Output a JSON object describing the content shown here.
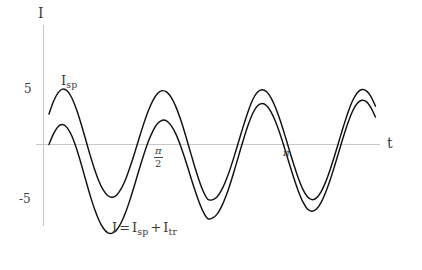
{
  "chart_data": {
    "type": "line",
    "title": "",
    "xlabel": "t",
    "ylabel": "I",
    "xlim": [
      -0.06,
      3.65
    ],
    "ylim": [
      -9.5,
      9.5
    ],
    "grid": false,
    "legend_position": "inline-annotations",
    "axis_labels": {
      "y_axis_symbol": "I",
      "x_axis_symbol": "t"
    },
    "y_ticks": [
      {
        "value": 5,
        "label": "5"
      },
      {
        "value": -5,
        "label": "-5"
      }
    ],
    "x_ticks": [
      {
        "value": 1.5707963,
        "label_numerator": "π",
        "label_denominator": "2"
      },
      {
        "value": 3.1415927,
        "label": "π"
      }
    ],
    "annotations": [
      {
        "name": "steady-state-curve-label",
        "text": "I_sp",
        "base": "I",
        "subscript": "sp",
        "x": 0.35,
        "y": 5.2
      },
      {
        "name": "total-curve-label",
        "text": "I = I_sp + I_tr",
        "parts": [
          "I",
          "=",
          "I",
          "sp",
          "+",
          "I",
          "tr"
        ],
        "x": 1.0,
        "y": -7.2
      }
    ],
    "series": [
      {
        "name": "I_sp",
        "label": "I_sp",
        "color": "#111111",
        "description": "steady-state sinusoidal current",
        "amplitude": 5.1,
        "angular_frequency": 6.0,
        "phase": 0.58,
        "points_x": [
          0.0,
          0.05,
          0.1,
          0.15,
          0.2,
          0.25,
          0.3,
          0.35,
          0.4,
          0.45,
          0.5,
          0.55,
          0.6,
          0.65,
          0.7,
          0.75,
          0.8,
          0.85,
          0.9,
          0.95,
          1.0,
          1.05,
          1.1,
          1.15,
          1.2,
          1.25,
          1.3,
          1.35,
          1.4,
          1.45,
          1.5,
          1.55,
          1.6,
          1.65,
          1.7,
          1.75,
          1.8,
          1.85,
          1.9,
          1.95,
          2.0,
          2.05,
          2.1,
          2.15,
          2.2,
          2.25,
          2.3,
          2.35,
          2.4,
          2.45,
          2.5,
          2.55,
          2.6,
          2.65,
          2.7,
          2.75,
          2.8,
          2.85,
          2.9,
          2.95,
          3.0,
          3.05,
          3.1,
          3.15,
          3.2,
          3.25,
          3.3,
          3.35,
          3.4,
          3.45,
          3.5,
          3.55,
          3.6
        ],
        "points_y": [
          2.79,
          3.94,
          4.74,
          5.08,
          4.93,
          4.31,
          3.3,
          2.02,
          0.59,
          -0.86,
          -2.2,
          -3.34,
          -4.19,
          -4.7,
          -4.84,
          -4.6,
          -4.0,
          -3.09,
          -1.93,
          -0.63,
          0.73,
          2.03,
          3.19,
          4.1,
          4.7,
          4.94,
          4.8,
          4.29,
          3.45,
          2.33,
          1.01,
          -0.41,
          -1.83,
          -3.16,
          -4.27,
          -5.02,
          -5.08,
          -4.84,
          -4.24,
          -3.33,
          -2.19,
          -0.88,
          0.5,
          1.87,
          3.13,
          4.17,
          4.81,
          5.03,
          4.84,
          4.26,
          3.35,
          2.2,
          0.88,
          -0.5,
          -1.85,
          -3.1,
          -4.12,
          -4.8,
          -5.06,
          -4.9,
          -4.34,
          -3.45,
          -2.31,
          -1.01,
          0.37,
          1.74,
          3.01,
          4.06,
          4.75,
          5.04,
          4.92,
          4.39,
          3.52
        ]
      },
      {
        "name": "I_total",
        "label": "I = I_sp + I_tr",
        "color": "#111111",
        "description": "total current = steady state plus decaying transient",
        "transient_amplitude": -2.8,
        "transient_decay": 0.95,
        "points_x": [
          0.0,
          0.05,
          0.1,
          0.15,
          0.2,
          0.25,
          0.3,
          0.35,
          0.4,
          0.45,
          0.5,
          0.55,
          0.6,
          0.65,
          0.7,
          0.75,
          0.8,
          0.85,
          0.9,
          0.95,
          1.0,
          1.05,
          1.1,
          1.15,
          1.2,
          1.25,
          1.3,
          1.35,
          1.4,
          1.45,
          1.5,
          1.55,
          1.6,
          1.65,
          1.7,
          1.75,
          1.8,
          1.85,
          1.9,
          1.95,
          2.0,
          2.05,
          2.1,
          2.15,
          2.2,
          2.25,
          2.3,
          2.35,
          2.4,
          2.45,
          2.5,
          2.55,
          2.6,
          2.65,
          2.7,
          2.75,
          2.8,
          2.85,
          2.9,
          2.95,
          3.0,
          3.05,
          3.1,
          3.15,
          3.2,
          3.25,
          3.3,
          3.35,
          3.4,
          3.45,
          3.5,
          3.55,
          3.6
        ],
        "points_y": [
          0.0,
          0.98,
          1.63,
          1.83,
          1.55,
          0.82,
          -0.28,
          -1.63,
          -3.1,
          -4.55,
          -5.85,
          -6.92,
          -7.68,
          -8.1,
          -8.13,
          -7.8,
          -7.11,
          -6.13,
          -4.9,
          -3.55,
          -2.15,
          -0.82,
          0.36,
          1.3,
          1.94,
          2.23,
          2.15,
          1.71,
          0.95,
          -0.09,
          -1.31,
          -2.63,
          -3.95,
          -5.16,
          -6.16,
          -6.8,
          -6.76,
          -6.43,
          -5.75,
          -4.77,
          -3.57,
          -2.21,
          -0.79,
          0.6,
          1.87,
          2.91,
          3.55,
          3.76,
          3.56,
          2.97,
          2.06,
          0.91,
          -0.4,
          -1.75,
          -3.08,
          -4.29,
          -5.27,
          -5.91,
          -6.12,
          -5.92,
          -5.33,
          -4.41,
          -3.26,
          -1.95,
          -0.57,
          0.8,
          2.06,
          3.1,
          3.78,
          4.06,
          3.93,
          3.39,
          2.52
        ]
      }
    ]
  }
}
